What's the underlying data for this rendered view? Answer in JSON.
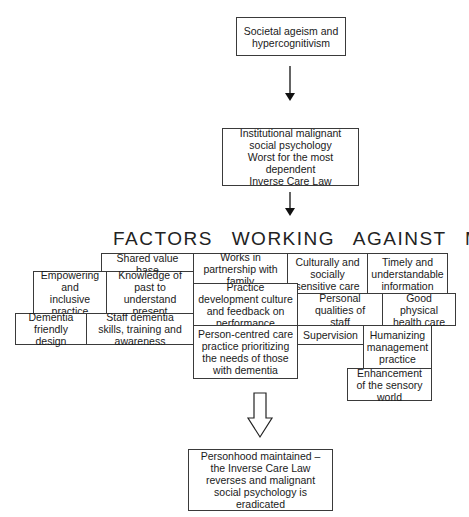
{
  "diagram": {
    "top_box": "Societal ageism and hypercognitivism",
    "institution_box": [
      "Institutional malignant",
      "social psychology",
      "Worst for the most",
      "dependent",
      "Inverse Care Law"
    ],
    "heading": "FACTORS WORKING AGAINST MSP",
    "factors": {
      "shared_value_base": "Shared value base",
      "works_in_partnership": "Works in partnership with family",
      "culturally_sensitive": "Culturally and socially sensitive care",
      "timely_information": "Timely and understandable information",
      "empowering": "Empowering and inclusive practice",
      "knowledge_of_past": "Knowledge of past to understand present",
      "practice_development": "Practice development culture and feedback on performance",
      "personal_qualities": "Personal qualities of staff",
      "good_physical": "Good physical health care",
      "dementia_friendly": "Dementia friendly design",
      "staff_skills": "Staff dementia skills, training and awareness",
      "person_centred": "Person-centred care practice prioritizing the needs of those with dementia",
      "supervision": "Supervision",
      "humanizing": "Humanizing management practice",
      "enhancement": "Enhancement of the sensory world"
    },
    "outcome_box": "Personhood maintained – the Inverse Care Law reverses and malignant social psychology is eradicated"
  }
}
